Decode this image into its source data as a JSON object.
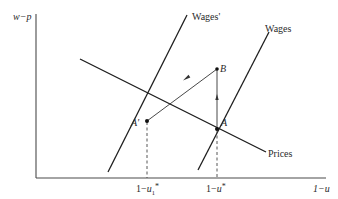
{
  "diagram": {
    "axes": {
      "y_label": "w−p",
      "x_label": "1−u",
      "x_ticks": [
        {
          "label_main": "1−u",
          "label_sub": "1",
          "label_sup": "*",
          "id": "1-u1*"
        },
        {
          "label_main": "1−u",
          "label_sub": "",
          "label_sup": "*",
          "id": "1-u*"
        }
      ]
    },
    "curves": [
      {
        "name": "Wages'",
        "label": "Wages'"
      },
      {
        "name": "Wages",
        "label": "Wages"
      },
      {
        "name": "Prices",
        "label": "Prices"
      }
    ],
    "points": [
      {
        "name": "A'",
        "label": "A'"
      },
      {
        "name": "A",
        "label": "A"
      },
      {
        "name": "B",
        "label": "B"
      }
    ],
    "arrows": [
      {
        "from": "A",
        "to": "B",
        "direction": "up"
      },
      {
        "from": "B",
        "to": "A'",
        "direction": "left-down"
      }
    ],
    "colors": {
      "line": "#1e1e1e",
      "background": "#ffffff"
    }
  }
}
